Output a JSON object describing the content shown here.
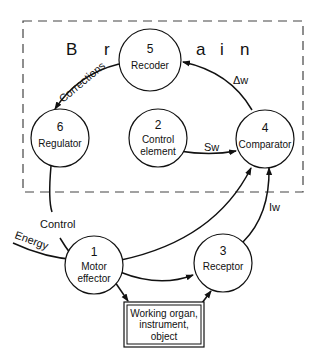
{
  "diagram": {
    "region_label_parts": [
      "B",
      "r",
      "a",
      "i",
      "n"
    ],
    "nodes": [
      {
        "id": "5",
        "number": "5",
        "line1": "Recoder",
        "line2": ""
      },
      {
        "id": "6",
        "number": "6",
        "line1": "Regulator",
        "line2": ""
      },
      {
        "id": "2",
        "number": "2",
        "line1": "Control",
        "line2": "element"
      },
      {
        "id": "4",
        "number": "4",
        "line1": "Comparator",
        "line2": ""
      },
      {
        "id": "1",
        "number": "1",
        "line1": "Motor",
        "line2": "effector"
      },
      {
        "id": "3",
        "number": "3",
        "line1": "Receptor",
        "line2": ""
      }
    ],
    "box": {
      "line1": "Working organ,",
      "line2": "instrument,",
      "line3": "object"
    },
    "edges": [
      {
        "from": "5",
        "to": "6",
        "label": "Corrections"
      },
      {
        "from": "4",
        "to": "5",
        "label": "Δw"
      },
      {
        "from": "2",
        "to": "4",
        "label": "Sw"
      },
      {
        "from": "6",
        "to": "1",
        "label": "Control"
      },
      {
        "from": "external",
        "to": "1",
        "label": "Energy"
      },
      {
        "from": "1",
        "to": "4",
        "label": ""
      },
      {
        "from": "1",
        "to": "3",
        "label": ""
      },
      {
        "from": "1",
        "to": "box",
        "label": ""
      },
      {
        "from": "box",
        "to": "3",
        "label": ""
      },
      {
        "from": "3",
        "to": "4",
        "label": "Iw"
      }
    ]
  }
}
